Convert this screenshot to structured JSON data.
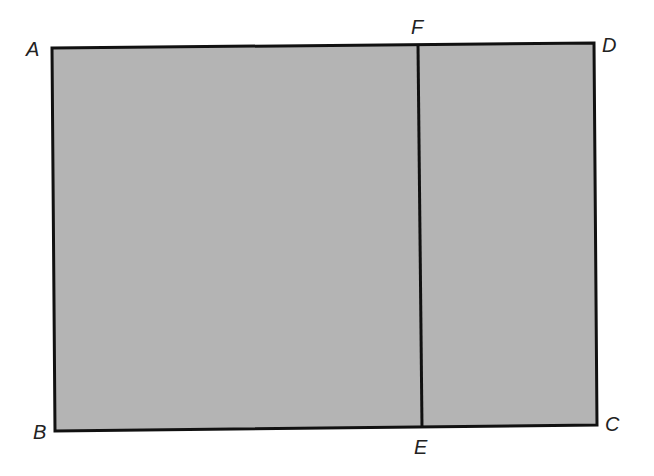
{
  "diagram": {
    "type": "rectangle-partition",
    "fill_color": "#b4b4b4",
    "stroke_color": "#111111",
    "vertices": {
      "A": {
        "label": "A",
        "x": 52,
        "y": 48
      },
      "B": {
        "label": "B",
        "x": 55,
        "y": 431
      },
      "C": {
        "label": "C",
        "x": 597,
        "y": 425
      },
      "D": {
        "label": "D",
        "x": 594,
        "y": 43
      },
      "E": {
        "label": "E",
        "x": 422,
        "y": 427
      },
      "F": {
        "label": "F",
        "x": 418,
        "y": 45
      }
    },
    "segments": [
      "AB",
      "BC",
      "CD",
      "DA",
      "FE"
    ],
    "regions": [
      "ABEF",
      "FECD"
    ]
  }
}
